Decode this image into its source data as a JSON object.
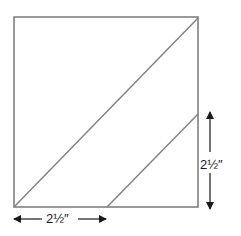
{
  "diagram": {
    "type": "quilt-block-cutting-diagram",
    "square": {
      "x": 14,
      "y": 17,
      "width": 184,
      "height": 190,
      "stroke": "#808080"
    },
    "lines": [
      {
        "name": "main-diagonal",
        "x1": 14,
        "y1": 207,
        "x2": 198,
        "y2": 18,
        "stroke": "#808080"
      },
      {
        "name": "secondary-diagonal",
        "x1": 107,
        "y1": 207,
        "x2": 198,
        "y2": 114,
        "stroke": "#808080"
      }
    ],
    "dimensions": {
      "bottom": {
        "label": "2½″",
        "arrow": {
          "x1": 13,
          "y1": 219,
          "x2": 106,
          "y2": 219
        }
      },
      "right": {
        "label": "2½″",
        "arrow": {
          "x1": 210,
          "y1": 111,
          "x2": 210,
          "y2": 210
        }
      }
    },
    "colors": {
      "outline": "#808080",
      "arrow": "#1a1a1a",
      "background": "#ffffff"
    }
  }
}
